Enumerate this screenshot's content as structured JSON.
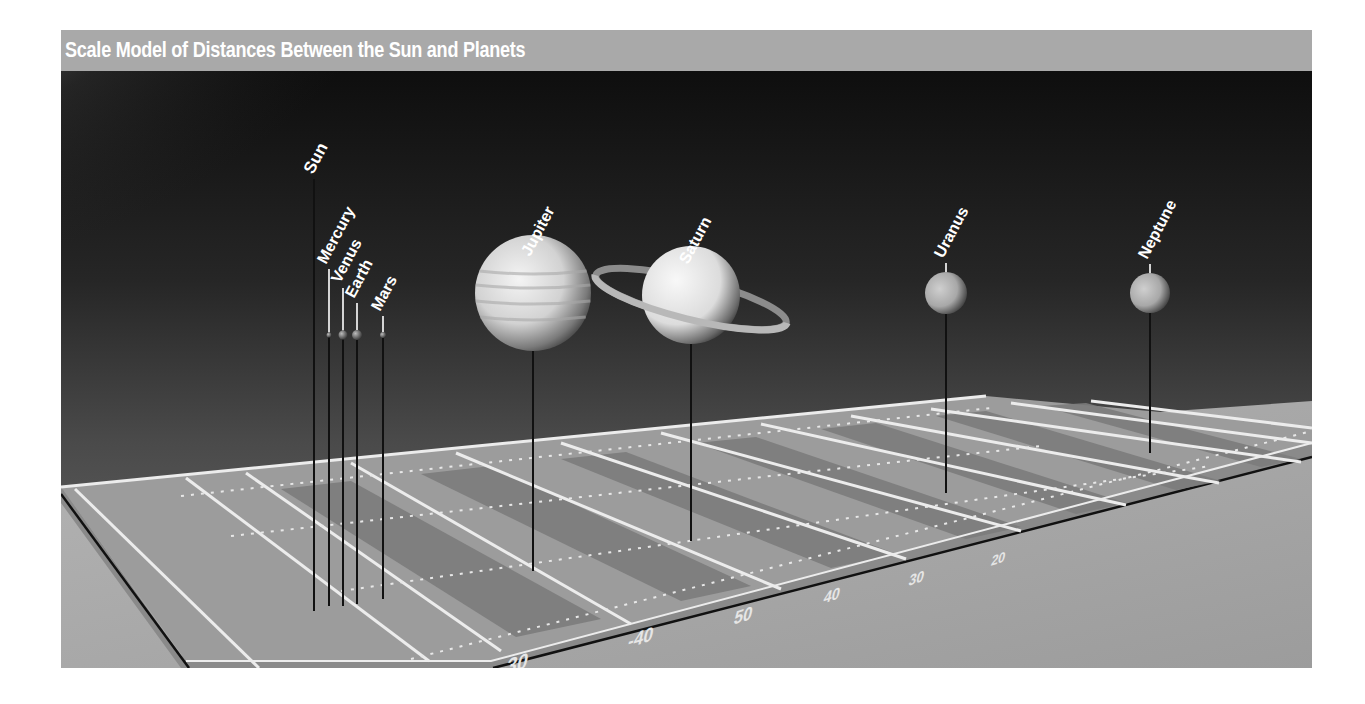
{
  "title": "Scale Model of Distances Between the Sun and Planets",
  "colors": {
    "title_bar": "#a9a9a9",
    "title_text": "#ffffff",
    "sky_dark": "#1a1a1a",
    "sky_mid": "#4a4a4a",
    "sun_glow": "#c8c8c8",
    "field_light": "#9a9a9a",
    "field_dark": "#7a7a7a",
    "field_lines": "#f0f0f0",
    "floor": "#a6a6a6",
    "pole": "#111111",
    "label": "#ffffff"
  },
  "bodies": [
    {
      "name": "Sun",
      "label_x": 255,
      "label_y": 108,
      "pole_top": 108,
      "pole_bottom": 540,
      "x": 253,
      "planet_y": null,
      "r": 0
    },
    {
      "name": "Mercury",
      "label_x": 268,
      "label_y": 198,
      "pole_top": 198,
      "pole_bottom": 535,
      "x": 268,
      "planet_y": 264,
      "r": 2.5
    },
    {
      "name": "Venus",
      "label_x": 282,
      "label_y": 217,
      "pole_top": 217,
      "pole_bottom": 535,
      "x": 282,
      "planet_y": 264,
      "r": 4.5
    },
    {
      "name": "Earth",
      "label_x": 296,
      "label_y": 232,
      "pole_top": 232,
      "pole_bottom": 533,
      "x": 296,
      "planet_y": 264,
      "r": 5
    },
    {
      "name": "Mars",
      "label_x": 322,
      "label_y": 245,
      "pole_top": 245,
      "pole_bottom": 528,
      "x": 322,
      "planet_y": 264,
      "r": 3
    },
    {
      "name": "Jupiter",
      "label_x": 472,
      "label_y": 190,
      "pole_top": 190,
      "pole_bottom": 500,
      "x": 472,
      "planet_y": 264,
      "r": 58
    },
    {
      "name": "Saturn",
      "label_x": 630,
      "label_y": 198,
      "pole_top": 198,
      "pole_bottom": 470,
      "x": 630,
      "planet_y": 264,
      "r": 49
    },
    {
      "name": "Uranus",
      "label_x": 885,
      "label_y": 192,
      "pole_top": 192,
      "pole_bottom": 422,
      "x": 885,
      "planet_y": 264,
      "r": 21
    },
    {
      "name": "Neptune",
      "label_x": 1089,
      "label_y": 193,
      "pole_top": 193,
      "pole_bottom": 382,
      "x": 1089,
      "planet_y": 264,
      "r": 20
    }
  ],
  "yard_labels": [
    {
      "text": "-10",
      "x": 445,
      "y": 562,
      "size": 24
    },
    {
      "text": "-20",
      "x": 590,
      "y": 540,
      "size": 22
    },
    {
      "text": "-30",
      "x": 720,
      "y": 514,
      "size": 20
    },
    {
      "text": "-40",
      "x": 835,
      "y": 490,
      "size": 18
    },
    {
      "text": "50",
      "x": 930,
      "y": 470,
      "size": 17
    },
    {
      "text": "40",
      "x": 1010,
      "y": 452,
      "size": 15
    },
    {
      "text": "30",
      "x": 1087,
      "y": 437,
      "size": 14
    },
    {
      "text": "20",
      "x": 1160,
      "y": 420,
      "size": 13
    }
  ]
}
